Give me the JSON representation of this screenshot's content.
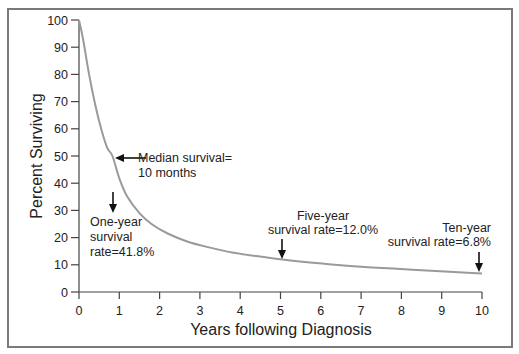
{
  "chart_data": {
    "type": "line",
    "title": "",
    "xlabel": "Years following Diagnosis",
    "ylabel": "Percent Surviving",
    "xlim": [
      0,
      10
    ],
    "ylim": [
      0,
      100
    ],
    "grid": false,
    "legend": null,
    "x_ticks": [
      0,
      1,
      2,
      3,
      4,
      5,
      6,
      7,
      8,
      9,
      10
    ],
    "y_ticks": [
      0,
      10,
      20,
      30,
      40,
      50,
      60,
      70,
      80,
      90,
      100
    ],
    "series": [
      {
        "name": "Survival",
        "color": "#9a9a9a",
        "x": [
          0,
          0.1,
          0.25,
          0.4,
          0.55,
          0.7,
          0.83,
          1.0,
          1.2,
          1.5,
          1.8,
          2.2,
          2.7,
          3.2,
          3.8,
          4.4,
          5.0,
          5.6,
          6.2,
          7.0,
          7.8,
          8.5,
          9.2,
          10.0
        ],
        "values": [
          100,
          93,
          80,
          69,
          60,
          53,
          50,
          41.8,
          35,
          29,
          25,
          21.5,
          18.5,
          16.5,
          14.5,
          13.2,
          12.0,
          11.0,
          10.2,
          9.3,
          8.6,
          8.0,
          7.4,
          6.8
        ]
      }
    ],
    "annotations": [
      {
        "id": "median",
        "lines": [
          "Median survival=",
          "10 months"
        ],
        "arrow": "left",
        "x": 0.83,
        "y": 50
      },
      {
        "id": "one-year",
        "lines": [
          "One-year",
          "survival",
          "rate=41.8%"
        ],
        "arrow": "down",
        "x": 1.0,
        "y": 41.8
      },
      {
        "id": "five-year",
        "lines": [
          "Five-year",
          "survival rate=12.0%"
        ],
        "arrow": "down",
        "x": 5.0,
        "y": 12.0
      },
      {
        "id": "ten-year",
        "lines": [
          "Ten-year",
          "survival rate=6.8%"
        ],
        "arrow": "down",
        "x": 10.0,
        "y": 6.8
      }
    ]
  },
  "labels": {
    "xlabel": "Years following Diagnosis",
    "ylabel": "Percent Surviving",
    "median_1": "Median survival=",
    "median_2": "10 months",
    "one_1": "One-year",
    "one_2": "survival",
    "one_3": "rate=41.8%",
    "five_1": "Five-year",
    "five_2": "survival rate=12.0%",
    "ten_1": "Ten-year",
    "ten_2": "survival rate=6.8%"
  }
}
